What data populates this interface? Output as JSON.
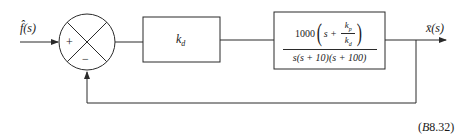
{
  "diagram": {
    "type": "feedback-control-block-diagram",
    "input_signal": {
      "symbol": "f̂",
      "argument": "(s)"
    },
    "output_signal": {
      "symbol": "x̄",
      "argument": "(s)"
    },
    "summing_junction": {
      "input_sign": "+",
      "feedback_sign": "−"
    },
    "controller_block": {
      "gain_symbol": "k",
      "gain_subscript": "d"
    },
    "plant_block": {
      "numerator_coefficient": "1000",
      "numerator_var": "s",
      "numerator_op": "+",
      "inner_num_symbol": "k",
      "inner_num_subscript": "p",
      "inner_den_symbol": "k",
      "inner_den_subscript": "d",
      "denominator_s": "s",
      "denominator_rest": "(s + 10)(s + 100)"
    },
    "feedback": "unity negative feedback",
    "figure_label": {
      "open": "(",
      "letter": "B",
      "number": "8.32)"
    }
  }
}
